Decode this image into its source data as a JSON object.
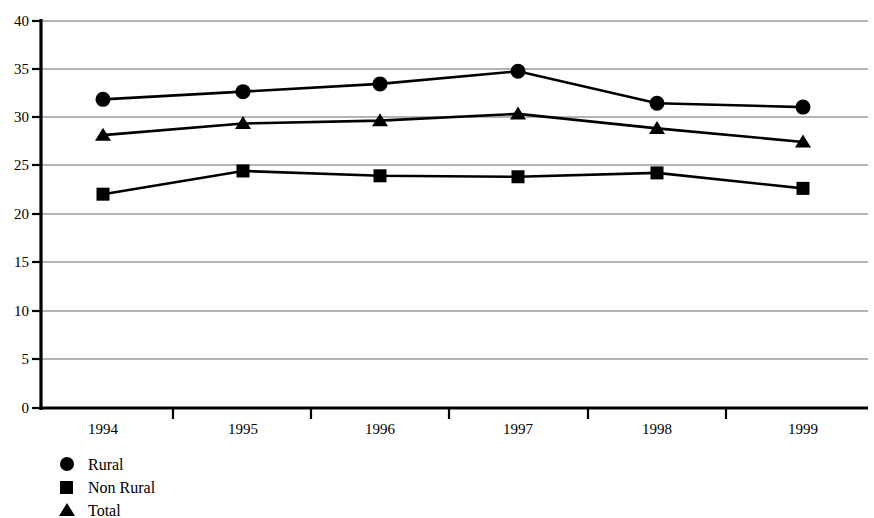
{
  "chart_data": {
    "type": "line",
    "title": "",
    "subtitle": "",
    "xlabel": "",
    "ylabel": "",
    "categories": [
      "1994",
      "1995",
      "1996",
      "1997",
      "1998",
      "1999"
    ],
    "x": [
      "1994",
      "1995",
      "1996",
      "1997",
      "1998",
      "1999"
    ],
    "ylim": [
      0,
      40
    ],
    "yticks": [
      0,
      5,
      10,
      15,
      20,
      25,
      30,
      35,
      40
    ],
    "ytick_labels": [
      "0",
      "5",
      "10",
      "15",
      "20",
      "25",
      "30",
      "35",
      "40"
    ],
    "grid": true,
    "grid_axis": "y",
    "legend_position": "bottom-left",
    "series": [
      {
        "name": "Rural",
        "marker": "circle",
        "color": "#000000",
        "values": [
          31.9,
          32.7,
          33.5,
          34.8,
          31.5,
          31.1
        ]
      },
      {
        "name": "Non Rural",
        "marker": "square",
        "color": "#000000",
        "values": [
          22.1,
          24.5,
          24.0,
          23.9,
          24.3,
          22.7
        ]
      },
      {
        "name": "Total",
        "marker": "triangle",
        "color": "#000000",
        "values": [
          28.2,
          29.4,
          29.7,
          30.4,
          28.9,
          27.5
        ]
      }
    ]
  },
  "legend": {
    "items": [
      {
        "label": "Rural",
        "marker": "circle-marker-icon"
      },
      {
        "label": "Non Rural",
        "marker": "square-marker-icon"
      },
      {
        "label": "Total",
        "marker": "triangle-marker-icon"
      }
    ]
  },
  "axes": {
    "y_tick_labels": [
      "40",
      "35",
      "30",
      "25",
      "20",
      "15",
      "10",
      "5",
      "0"
    ],
    "x_tick_labels": [
      "1994",
      "1995",
      "1996",
      "1997",
      "1998",
      "1999"
    ]
  }
}
